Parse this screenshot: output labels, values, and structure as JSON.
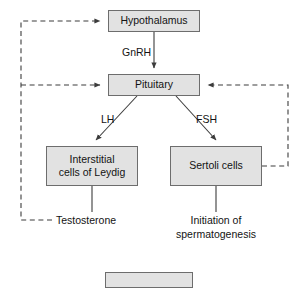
{
  "diagram": {
    "colors": {
      "box_fill": "#e2e2e2",
      "box_border": "#6d6d6d",
      "line": "#3c3c3c",
      "dashed_line": "#3c3c3c",
      "text": "#131313",
      "background": "#ffffff"
    },
    "nodes": [
      {
        "id": "hypothalamus",
        "label": "Hypothalamus"
      },
      {
        "id": "pituitary",
        "label": "Pituitary"
      },
      {
        "id": "leydig",
        "label_line1": "Interstitial",
        "label_line2": "cells of Leydig"
      },
      {
        "id": "sertoli",
        "label": "Sertoli cells"
      }
    ],
    "edge_labels": {
      "gnrh": "GnRH",
      "lh": "LH",
      "fsh": "FSH"
    },
    "outcomes": {
      "testosterone": "Testosterone",
      "initiation_line1": "Initiation of",
      "initiation_line2": "spermatogenesis"
    },
    "edges": [
      {
        "from": "hypothalamus",
        "to": "pituitary",
        "label": "GnRH",
        "style": "solid",
        "arrow": "down"
      },
      {
        "from": "pituitary",
        "to": "leydig",
        "label": "LH",
        "style": "solid",
        "arrow": "down-left"
      },
      {
        "from": "pituitary",
        "to": "sertoli",
        "label": "FSH",
        "style": "solid",
        "arrow": "down-right"
      },
      {
        "from": "leydig",
        "to": "testosterone",
        "style": "solid",
        "arrow": "none"
      },
      {
        "from": "sertoli",
        "to": "initiation",
        "style": "solid",
        "arrow": "none"
      },
      {
        "from": "testosterone",
        "to": "hypothalamus",
        "style": "dashed",
        "arrow": "right",
        "type": "negative-feedback"
      },
      {
        "from": "testosterone",
        "to": "pituitary",
        "style": "dashed",
        "arrow": "right",
        "type": "negative-feedback"
      },
      {
        "from": "sertoli",
        "to": "pituitary",
        "style": "dashed",
        "arrow": "left",
        "type": "negative-feedback"
      }
    ]
  }
}
